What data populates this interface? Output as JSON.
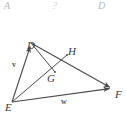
{
  "header": {
    "letters": [
      {
        "text": "A"
      },
      {
        "text": "?"
      },
      {
        "text": "D"
      }
    ]
  },
  "figure": {
    "stroke_color": "#4a4a4a",
    "label_color": "#3a3a3a",
    "background": "#ffffff",
    "points": {
      "D": {
        "label": "D",
        "x": 31,
        "y": 27
      },
      "E": {
        "label": "E",
        "x": 12,
        "y": 86
      },
      "F": {
        "label": "F",
        "x": 113,
        "y": 72
      },
      "G": {
        "label": "G",
        "x": 55,
        "y": 56
      },
      "H": {
        "label": "H",
        "x": 67,
        "y": 39
      }
    },
    "edges": [
      {
        "name": "segment-E-D",
        "from": "E",
        "to": "D",
        "arrow": "end"
      },
      {
        "name": "segment-E-F",
        "from": "E",
        "to": "F",
        "arrow": "end"
      },
      {
        "name": "segment-D-F",
        "from": "D",
        "to": "F",
        "arrow": "end"
      },
      {
        "name": "segment-D-G",
        "from": "D",
        "to": "G",
        "arrow": "none"
      },
      {
        "name": "segment-E-H",
        "from": "E",
        "to": "H",
        "arrow": "none"
      }
    ],
    "measures": [
      {
        "name": "vector-v",
        "text": "v",
        "edge": "segment-E-D"
      },
      {
        "name": "vector-w",
        "text": "w",
        "edge": "segment-E-F"
      }
    ]
  }
}
